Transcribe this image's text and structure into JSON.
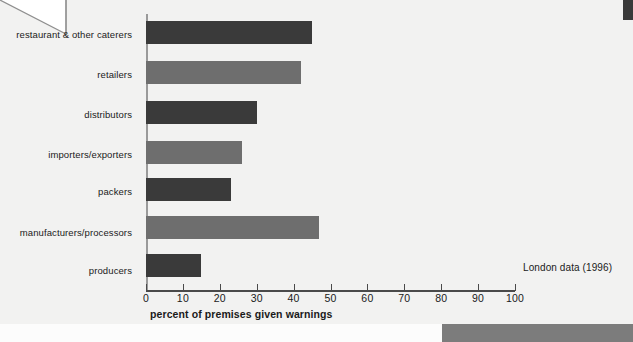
{
  "chart_data": {
    "type": "bar",
    "orientation": "horizontal",
    "title": "",
    "xlabel": "percent of premises given warnings",
    "ylabel": "",
    "xlim": [
      0,
      100
    ],
    "xticks": [
      0,
      10,
      20,
      30,
      40,
      50,
      60,
      70,
      80,
      90,
      100
    ],
    "grid": false,
    "legend": "none",
    "annotation": "London data (1996)",
    "categories": [
      "restaurant & other caterers",
      "retailers",
      "distributors",
      "importers/exporters",
      "packers",
      "manufacturers/processors",
      "producers"
    ],
    "values": [
      45,
      42,
      30,
      26,
      23,
      47,
      15
    ],
    "bar_colors": [
      "#3a3a3a",
      "#6e6e6e",
      "#3a3a3a",
      "#6e6e6e",
      "#3a3a3a",
      "#6e6e6e",
      "#3a3a3a"
    ]
  },
  "colors": {
    "dark_bar": "#3a3a3a",
    "light_bar": "#6e6e6e",
    "axis": "#4a4a4a",
    "y_axis": "#9a9a9a",
    "page_background": "#f2f2f1",
    "accent_band": "#7c7c7c"
  },
  "decorations": {
    "page_fold": "page-fold-corner",
    "right_tab": "right-dark-tab",
    "bottom_band": "bottom-gray-band"
  }
}
